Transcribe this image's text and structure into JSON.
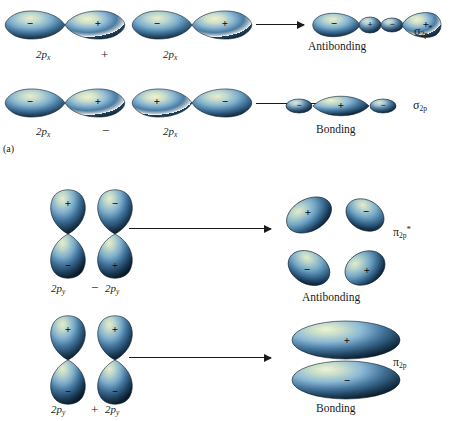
{
  "figure": {
    "panel_label": "(a)",
    "background": "#ffffff",
    "orbital_colors": {
      "highlight": "#e9efc9",
      "mid_light": "#9cc4dc",
      "mid": "#4a7fa5",
      "dark": "#1b3a52",
      "darkest": "#0d2234",
      "outline": "#0c1c2a"
    },
    "sign_positive": "+",
    "sign_negative": "−"
  },
  "rows": [
    {
      "id": "sigma-antibonding",
      "left_orbital_label": "2p",
      "left_orbital_sub": "x",
      "operator": "+",
      "right_orbital_label": "2p",
      "right_orbital_sub": "x",
      "result_caption": "Antibonding",
      "result_symbol": "σ",
      "result_sub": "2p",
      "result_star": "*"
    },
    {
      "id": "sigma-bonding",
      "left_orbital_label": "2p",
      "left_orbital_sub": "x",
      "operator": "−",
      "right_orbital_label": "2p",
      "right_orbital_sub": "x",
      "result_caption": "Bonding",
      "result_symbol": "σ",
      "result_sub": "2p",
      "result_star": ""
    },
    {
      "id": "pi-antibonding",
      "left_orbital_label": "2p",
      "left_orbital_sub": "y",
      "operator": "−",
      "right_orbital_label": "2p",
      "right_orbital_sub": "y",
      "result_caption": "Antibonding",
      "result_symbol": "π",
      "result_sub": "2p",
      "result_star": "*"
    },
    {
      "id": "pi-bonding",
      "left_orbital_label": "2p",
      "left_orbital_sub": "y",
      "operator": "+",
      "right_orbital_label": "2p",
      "right_orbital_sub": "y",
      "result_caption": "Bonding",
      "result_symbol": "π",
      "result_sub": "2p",
      "result_star": ""
    }
  ],
  "signs": {
    "row1_left_orbital": [
      "−",
      "+"
    ],
    "row1_right_orbital": [
      "−",
      "+"
    ],
    "row1_result": [
      "−",
      "+",
      "−",
      "+"
    ],
    "row2_left_orbital": [
      "−",
      "+"
    ],
    "row2_right_orbital": [
      "+",
      "−"
    ],
    "row2_result": [
      "−",
      "+",
      "−"
    ],
    "row3_left_orbital": [
      "+",
      "−"
    ],
    "row3_right_orbital": [
      "−",
      "+"
    ],
    "row3_result": [
      "+",
      "−",
      "−",
      "+"
    ],
    "row4_left_orbital": [
      "+",
      "−"
    ],
    "row4_right_orbital": [
      "+",
      "−"
    ],
    "row4_result": [
      "+",
      "−"
    ]
  }
}
